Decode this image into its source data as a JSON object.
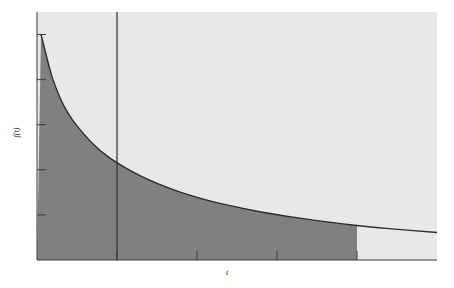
{
  "chart_data": {
    "type": "area",
    "title": "",
    "subtitle": "",
    "xlabel": "t",
    "ylabel": "f(t)",
    "grid": false,
    "legend": null,
    "xlim": [
      0,
      5
    ],
    "ylim": [
      0,
      1.1
    ],
    "x_ticks": [
      1,
      2,
      3,
      4
    ],
    "y_ticks": [
      0.2,
      0.4,
      0.6,
      0.8,
      1.0
    ],
    "x_tick_labels": [
      "",
      "",
      "",
      ""
    ],
    "y_tick_labels": [
      "",
      "",
      "",
      "",
      ""
    ],
    "series": [
      {
        "name": "f(t)",
        "description": "monotonically decreasing decay curve",
        "x": [
          0.05,
          0.1,
          0.15,
          0.2,
          0.3,
          0.4,
          0.5,
          0.7,
          0.9,
          1.1,
          1.3,
          1.5,
          1.8,
          2.1,
          2.4,
          2.8,
          3.2,
          3.6,
          4.0,
          4.4,
          5.0
        ],
        "y": [
          1.0,
          0.93,
          0.86,
          0.8,
          0.71,
          0.645,
          0.595,
          0.515,
          0.455,
          0.41,
          0.372,
          0.34,
          0.3,
          0.268,
          0.242,
          0.213,
          0.19,
          0.17,
          0.153,
          0.139,
          0.122
        ]
      }
    ],
    "shaded_region": {
      "name": "integral-region",
      "from_x": 0,
      "to_x": 4.0,
      "fill_color": "#808080"
    },
    "background_region": {
      "name": "plot-background",
      "fill_color": "#e8e8e8"
    },
    "vertical_marker": {
      "name": "vertical-line",
      "x": 1.0,
      "color": "#3a3a3a"
    },
    "curve_color": "#2b2b2b",
    "axis_color": "#3a3a3a"
  },
  "labels": {
    "y_axis": "f(t)",
    "x_axis": "t"
  }
}
